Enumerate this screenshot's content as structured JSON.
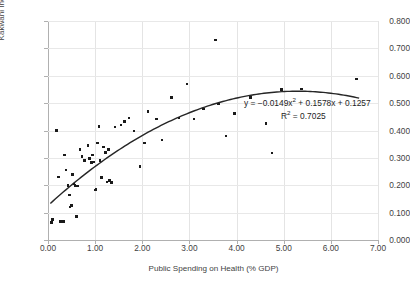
{
  "chart_data": {
    "type": "scatter",
    "title": "",
    "xlabel": "Public Spending on Health (% GDP)",
    "ylabel": "Kakwani Index of Life Expectancy",
    "xlim": [
      0.0,
      7.0
    ],
    "ylim": [
      0.0,
      0.8
    ],
    "xticks": [
      "0.00",
      "1.00",
      "2.00",
      "3.00",
      "4.00",
      "5.00",
      "6.00",
      "7.00"
    ],
    "xtick_values": [
      0.0,
      1.0,
      2.0,
      3.0,
      4.0,
      5.0,
      6.0,
      7.0
    ],
    "yticks": [
      "0.000",
      "0.100",
      "0.200",
      "0.300",
      "0.400",
      "0.500",
      "0.600",
      "0.700",
      "0.800"
    ],
    "ytick_values": [
      0.0,
      0.1,
      0.2,
      0.3,
      0.4,
      0.5,
      0.6,
      0.7,
      0.8
    ],
    "grid": true,
    "legend": null,
    "marker_color": "#1a1a1a",
    "trendline_color": "#262626",
    "annotations": [
      "y = −0.0149x² + 0.1578x + 0.1257",
      "R² = 0.7025"
    ],
    "equation_text": "y = −0.0149x² + 0.1578x + 0.1257",
    "r_squared_text": "R² = 0.7025",
    "r_squared_value": 0.7025,
    "trendline": {
      "type": "polynomial",
      "degree": 2,
      "coefficients": {
        "a": -0.0149,
        "b": 0.1578,
        "c": 0.1257
      },
      "x_start": 0.05,
      "x_end": 6.6
    },
    "points": [
      [
        0.07,
        0.065
      ],
      [
        0.1,
        0.075
      ],
      [
        0.18,
        0.4
      ],
      [
        0.22,
        0.23
      ],
      [
        0.26,
        0.068
      ],
      [
        0.3,
        0.068
      ],
      [
        0.33,
        0.067
      ],
      [
        0.35,
        0.31
      ],
      [
        0.38,
        0.255
      ],
      [
        0.42,
        0.2
      ],
      [
        0.45,
        0.165
      ],
      [
        0.47,
        0.12
      ],
      [
        0.5,
        0.125
      ],
      [
        0.52,
        0.24
      ],
      [
        0.55,
        0.205
      ],
      [
        0.57,
        0.2
      ],
      [
        0.6,
        0.085
      ],
      [
        0.62,
        0.198
      ],
      [
        0.68,
        0.33
      ],
      [
        0.72,
        0.305
      ],
      [
        0.78,
        0.29
      ],
      [
        0.85,
        0.345
      ],
      [
        0.88,
        0.298
      ],
      [
        0.92,
        0.283
      ],
      [
        0.95,
        0.31
      ],
      [
        0.97,
        0.285
      ],
      [
        1.0,
        0.182
      ],
      [
        1.02,
        0.185
      ],
      [
        1.05,
        0.355
      ],
      [
        1.08,
        0.415
      ],
      [
        1.1,
        0.29
      ],
      [
        1.13,
        0.228
      ],
      [
        1.18,
        0.34
      ],
      [
        1.22,
        0.32
      ],
      [
        1.25,
        0.212
      ],
      [
        1.28,
        0.33
      ],
      [
        1.3,
        0.218
      ],
      [
        1.35,
        0.21
      ],
      [
        1.42,
        0.413
      ],
      [
        1.55,
        0.42
      ],
      [
        1.62,
        0.432
      ],
      [
        1.72,
        0.445
      ],
      [
        1.82,
        0.398
      ],
      [
        1.95,
        0.268
      ],
      [
        2.05,
        0.355
      ],
      [
        2.12,
        0.47
      ],
      [
        2.3,
        0.442
      ],
      [
        2.42,
        0.365
      ],
      [
        2.62,
        0.52
      ],
      [
        2.78,
        0.445
      ],
      [
        2.95,
        0.57
      ],
      [
        3.1,
        0.442
      ],
      [
        3.3,
        0.478
      ],
      [
        3.55,
        0.73
      ],
      [
        3.62,
        0.497
      ],
      [
        3.78,
        0.38
      ],
      [
        3.95,
        0.462
      ],
      [
        4.3,
        0.52
      ],
      [
        4.62,
        0.425
      ],
      [
        4.75,
        0.318
      ],
      [
        4.95,
        0.55
      ],
      [
        5.38,
        0.552
      ],
      [
        6.55,
        0.588
      ]
    ]
  }
}
